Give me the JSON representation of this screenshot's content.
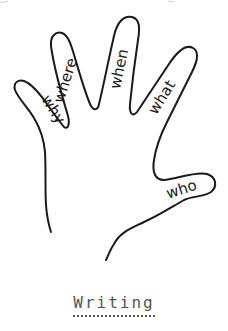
{
  "diagram": {
    "type": "hand-outline",
    "fingers": [
      {
        "name": "pinky",
        "label": "why"
      },
      {
        "name": "ring",
        "label": "where"
      },
      {
        "name": "middle",
        "label": "when"
      },
      {
        "name": "index",
        "label": "what"
      },
      {
        "name": "thumb",
        "label": "who"
      }
    ],
    "colors": {
      "outline": "#1a1a1a",
      "caption": "#555555",
      "background": "#ffffff"
    }
  },
  "caption": {
    "title": "Writing"
  }
}
